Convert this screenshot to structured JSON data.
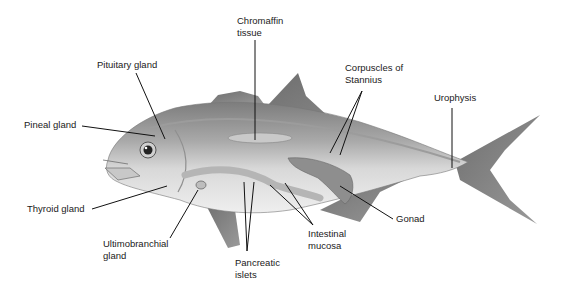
{
  "figure": {
    "labels": [
      {
        "id": "chromaffin",
        "text": "Chromaffin\ntissue",
        "x": 237,
        "y": 15
      },
      {
        "id": "pituitary",
        "text": "Pituitary gland",
        "x": 97,
        "y": 59
      },
      {
        "id": "corpuscles",
        "text": "Corpuscles of\nStannius",
        "x": 345,
        "y": 62
      },
      {
        "id": "urophysis",
        "text": "Urophysis",
        "x": 434,
        "y": 92
      },
      {
        "id": "pineal",
        "text": "Pineal gland",
        "x": 24,
        "y": 119
      },
      {
        "id": "thyroid",
        "text": "Thyroid gland",
        "x": 27,
        "y": 203
      },
      {
        "id": "gonad",
        "text": "Gonad",
        "x": 396,
        "y": 213
      },
      {
        "id": "intestinal",
        "text": "Intestinal\nmucosa",
        "x": 308,
        "y": 228
      },
      {
        "id": "ultimobranchial",
        "text": "Ultimobranchial\ngland",
        "x": 103,
        "y": 238
      },
      {
        "id": "pancreatic",
        "text": "Pancreatic\nislets",
        "x": 235,
        "y": 257
      }
    ]
  },
  "colors": {
    "background": "#ffffff",
    "text": "#1a1a1a",
    "leader": "#111111",
    "body_dark": "#8a8a8a",
    "body_light": "#e4e4e4",
    "fin": "#7a7a7a"
  }
}
